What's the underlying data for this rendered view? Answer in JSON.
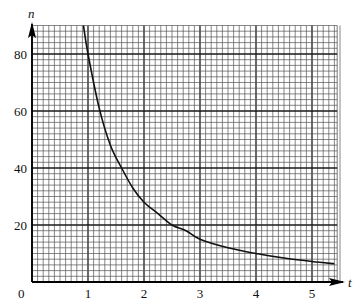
{
  "chart_data": {
    "type": "line",
    "title": "",
    "xlabel": "t",
    "ylabel": "n",
    "xlim": [
      0,
      5.45
    ],
    "ylim": [
      0,
      90
    ],
    "x_ticks": [
      0,
      1,
      2,
      3,
      4,
      5
    ],
    "y_ticks": [
      20,
      40,
      60,
      80
    ],
    "origin_label": "0",
    "grid": {
      "major_x": 1,
      "minor_x": 0.1,
      "major_y": 20,
      "minor_y": 2
    },
    "legend": null,
    "series": [
      {
        "name": "n",
        "x": [
          0.91,
          1.0,
          1.2,
          1.4,
          1.6,
          1.8,
          2.0,
          2.25,
          2.5,
          2.75,
          3.0,
          3.5,
          4.0,
          4.5,
          5.0,
          5.4
        ],
        "values": [
          92,
          80,
          61,
          48,
          40,
          33,
          28,
          24,
          20,
          18,
          15,
          12,
          10,
          8.4,
          7.2,
          6.4
        ]
      }
    ]
  },
  "labels": {
    "x_axis": "t",
    "y_axis": "n",
    "origin": "0",
    "x_tick_labels": [
      "1",
      "2",
      "3",
      "4",
      "5"
    ],
    "y_tick_labels": [
      "20",
      "40",
      "60",
      "80"
    ]
  },
  "colors": {
    "minor_grid": "#555555",
    "major_grid": "#1a1a1a",
    "curve": "#111111",
    "axis": "#000000"
  }
}
